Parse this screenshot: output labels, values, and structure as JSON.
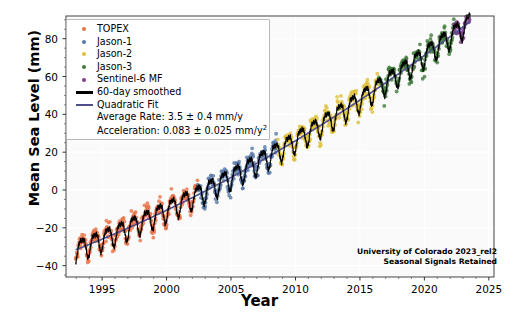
{
  "chart_data": {
    "type": "scatter",
    "title": "",
    "xlabel": "Year",
    "ylabel": "Mean Sea Level (mm)",
    "xlim": [
      1992.2,
      2025.4
    ],
    "ylim": [
      -46,
      92
    ],
    "xticks": [
      1995,
      2000,
      2005,
      2010,
      2015,
      2020,
      2025
    ],
    "yticks": [
      -40,
      -20,
      0,
      20,
      40,
      60,
      80
    ],
    "grid": true,
    "legend_position": "upper left",
    "series": [
      {
        "name": "TOPEX",
        "color": "#e8734a",
        "start": 1992.95,
        "end": 2002.45
      },
      {
        "name": "Jason-1",
        "color": "#5878a8",
        "start": 2002.45,
        "end": 2008.6
      },
      {
        "name": "Jason-2",
        "color": "#e0c038",
        "start": 2008.6,
        "end": 2016.45
      },
      {
        "name": "Jason-3",
        "color": "#3f7a3a",
        "start": 2016.45,
        "end": 2022.3
      },
      {
        "name": "Sentinel-6 MF",
        "color": "#7b3f8c",
        "start": 2022.3,
        "end": 2023.55
      }
    ],
    "fit": {
      "quadratic_color": "#4f4f8c",
      "smoothed_color": "#000000",
      "epoch": 1993.0,
      "intercept_mm": -31.5,
      "rate_mm_per_y": 2.68,
      "accel_mm_per_y2": 0.083,
      "seasonal_amplitude_mm": 5.2,
      "seasonal_phase_frac": 0.18,
      "semiannual_amplitude_mm": 1.6,
      "scatter_noise_mm": 3.6
    },
    "annotations": {
      "credit_line1": "University of Colorado 2023_rel2",
      "credit_line2": "Seasonal Signals Retained"
    }
  },
  "legend": {
    "entries": [
      {
        "label": "TOPEX",
        "key": "dot",
        "color": "#e8734a"
      },
      {
        "label": "Jason-1",
        "key": "dot",
        "color": "#5878a8"
      },
      {
        "label": "Jason-2",
        "key": "dot",
        "color": "#e0c038"
      },
      {
        "label": "Jason-3",
        "key": "dot",
        "color": "#3f7a3a"
      },
      {
        "label": "Sentinel-6 MF",
        "key": "dot",
        "color": "#7b3f8c"
      },
      {
        "label": "60-day smoothed",
        "key": "line",
        "color": "#000000"
      },
      {
        "label": "Quadratic Fit",
        "key": "line",
        "color": "#4f4f8c"
      },
      {
        "label": "Average Rate: 3.5 ± 0.4 mm/y",
        "key": "none",
        "color": ""
      },
      {
        "label": "Acceleration: 0.083 ± 0.025 mm/y²",
        "key": "none",
        "color": ""
      }
    ]
  },
  "axes": {
    "xlabel": "Year",
    "ylabel": "Mean Sea Level (mm)"
  }
}
